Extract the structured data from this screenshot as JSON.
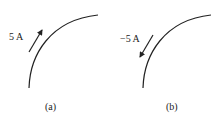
{
  "panels": [
    {
      "id": "a",
      "current_label": "5 A",
      "caption": "(a)",
      "arrow_direction": "up-right"
    },
    {
      "id": "b",
      "current_label": "−5 A",
      "caption": "(b)",
      "arrow_direction": "down-left"
    }
  ],
  "colors": {
    "stroke": "#222222"
  }
}
